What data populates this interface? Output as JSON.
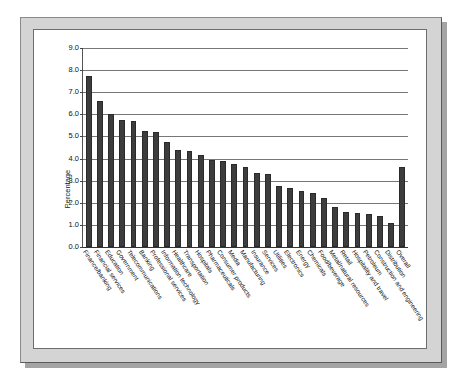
{
  "chart_data": {
    "type": "bar",
    "title": "",
    "subtitle": "",
    "xlabel": "",
    "ylabel": "Percentage",
    "ylim": [
      0.0,
      9.0
    ],
    "ytick_labels": [
      "0.0",
      "1.0",
      "2.0",
      "3.0",
      "4.0",
      "5.0",
      "6.0",
      "7.0",
      "8.0",
      "9.0"
    ],
    "ytick_values": [
      0.0,
      1.0,
      2.0,
      3.0,
      4.0,
      5.0,
      6.0,
      7.0,
      8.0,
      9.0
    ],
    "grid": true,
    "legend": false,
    "legend_position": "none",
    "bar_color": "#3d3d3d",
    "categories": [
      "Finance/banking",
      "Financial services",
      "Education",
      "Government",
      "Telecommunications",
      "Banking",
      "Professional services",
      "Information technology",
      "Healthcare",
      "Transportation",
      "Hospitals",
      "Pharmaceuticals",
      "Consumer products",
      "Media",
      "Manufacturing",
      "Insurance",
      "Services",
      "Utilities",
      "Electronics",
      "Energy",
      "Chemicals",
      "Food/beverage",
      "Metal/natural resources",
      "Retail",
      "Hospitality and travel",
      "Petroleum",
      "Construction and engineering",
      "Distribution",
      "Overall"
    ],
    "values": [
      7.75,
      6.6,
      6.0,
      5.75,
      5.7,
      5.25,
      5.2,
      4.75,
      4.4,
      4.35,
      4.15,
      3.95,
      3.9,
      3.75,
      3.6,
      3.35,
      3.3,
      2.75,
      2.65,
      2.55,
      2.45,
      2.2,
      1.8,
      1.6,
      1.55,
      1.5,
      1.4,
      1.1,
      3.6
    ]
  },
  "frame": {
    "mat_color": "#d4d4d4",
    "plot_background": "#ffffff"
  }
}
